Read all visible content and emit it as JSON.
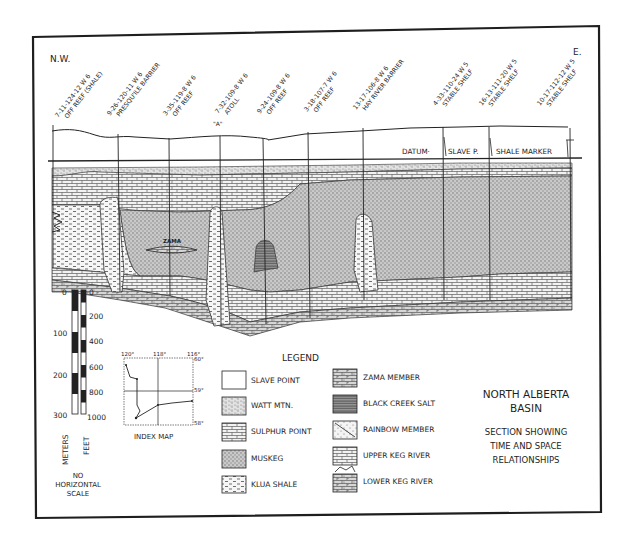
{
  "diagram": {
    "direction_left": "N.W.",
    "direction_right": "E.",
    "datum_label": "DATUM·",
    "datum_marker_left": "SLAVE P.",
    "datum_marker_right": "SHALE MARKER",
    "zama_lens_label": "ZAMA",
    "well_a_marker": "\"A\"",
    "wells": [
      {
        "id": "7-11-124-12 W 6",
        "desc": "OFF REEF (SHALE)"
      },
      {
        "id": "9-26-120-11 W 6",
        "desc": "PRESQU'ILE BARRIER"
      },
      {
        "id": "3-35-119-8 W 6",
        "desc": "OFF REEF"
      },
      {
        "id": "7-32-109-8 W 6",
        "desc": "ATOLL"
      },
      {
        "id": "9-24-109-8 W 6",
        "desc": "OFF REEF"
      },
      {
        "id": "3-18-107-7 W 6",
        "desc": "OFF REEF"
      },
      {
        "id": "13-17-106-8 W 6",
        "desc": "HAY RIVER BARRIER"
      },
      {
        "id": "4-33-110-24 W 5",
        "desc": "STABLE SHELF"
      },
      {
        "id": "16-13-111-20 W 5",
        "desc": "STABLE SHELF"
      },
      {
        "id": "10-17-112-12 W 5",
        "desc": "STABLE SHELF"
      }
    ]
  },
  "vertical_scale": {
    "meters_label": "METERS",
    "feet_label": "FEET",
    "meters_ticks": [
      "0",
      "100",
      "200",
      "300"
    ],
    "feet_ticks": [
      "0",
      "200",
      "400",
      "600",
      "800",
      "1000"
    ],
    "note_line1": "NO",
    "note_line2": "HORIZONTAL",
    "note_line3": "SCALE"
  },
  "index_map": {
    "title": "INDEX MAP",
    "lon_labels": [
      "120°",
      "118°",
      "116°"
    ],
    "lat_labels": [
      "60°",
      "59°",
      "58°"
    ]
  },
  "legend": {
    "title": "LEGEND",
    "items_left": [
      {
        "label": "SLAVE POINT",
        "pattern": "blank"
      },
      {
        "label": "WATT MTN.",
        "pattern": "stipple-dash"
      },
      {
        "label": "SULPHUR POINT",
        "pattern": "brick"
      },
      {
        "label": "MUSKEG",
        "pattern": "dense-stipple"
      },
      {
        "label": "KLUA SHALE",
        "pattern": "dash"
      }
    ],
    "items_right": [
      {
        "label": "ZAMA MEMBER",
        "pattern": "brick-stipple"
      },
      {
        "label": "BLACK CREEK SALT",
        "pattern": "horizontal-lines"
      },
      {
        "label": "RAINBOW MEMBER",
        "pattern": "diagonal-dots"
      },
      {
        "label": "UPPER KEG RIVER",
        "pattern": "brick"
      },
      {
        "label": "LOWER KEG RIVER",
        "pattern": "stipple-brick"
      }
    ]
  },
  "title_block": {
    "title_line1": "NORTH ALBERTA",
    "title_line2": "BASIN",
    "subtitle_line1": "SECTION SHOWING",
    "subtitle_line2": "TIME AND SPACE",
    "subtitle_line3": "RELATIONSHIPS"
  }
}
